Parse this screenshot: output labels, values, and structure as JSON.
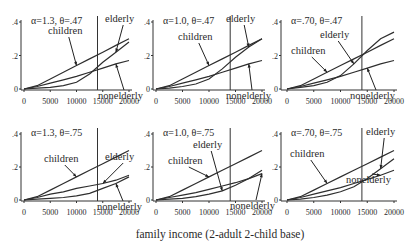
{
  "figure": {
    "xlabel": "family income (2-adult 2-child base)",
    "vertical_line_x": 14000
  },
  "chart_data": [
    {
      "type": "line",
      "title": "α=1.3, θ=.47",
      "xlabel": "family income (2-adult 2-child base)",
      "ylabel": "",
      "xlim": [
        0,
        20000
      ],
      "ylim": [
        0,
        0.4
      ],
      "x_ticks": [
        "0",
        "5000",
        "10000",
        "15000",
        "20000"
      ],
      "y_ticks": [
        "0",
        ".2",
        ".4"
      ],
      "vertical_line": 14000,
      "x": [
        0,
        2500,
        5000,
        7500,
        10000,
        12500,
        15000,
        17500,
        20000
      ],
      "series": [
        {
          "name": "children",
          "values": [
            0,
            0.02,
            0.06,
            0.1,
            0.14,
            0.18,
            0.22,
            0.26,
            0.3
          ]
        },
        {
          "name": "elderly",
          "values": [
            0,
            0.005,
            0.01,
            0.02,
            0.04,
            0.09,
            0.16,
            0.22,
            0.28
          ]
        },
        {
          "name": "nonelderly",
          "values": [
            0,
            0.015,
            0.035,
            0.055,
            0.075,
            0.1,
            0.125,
            0.15,
            0.17
          ]
        }
      ]
    },
    {
      "type": "line",
      "title": "α=1.0, θ=.47",
      "xlabel": "family income (2-adult 2-child base)",
      "ylabel": "",
      "xlim": [
        0,
        20000
      ],
      "ylim": [
        0,
        0.4
      ],
      "x_ticks": [
        "0",
        "5000",
        "10000",
        "15000",
        "20000"
      ],
      "y_ticks": [
        "0",
        ".2",
        ".4"
      ],
      "vertical_line": 14000,
      "x": [
        0,
        2500,
        5000,
        7500,
        10000,
        12500,
        15000,
        17500,
        20000
      ],
      "series": [
        {
          "name": "children",
          "values": [
            0,
            0.02,
            0.06,
            0.1,
            0.14,
            0.18,
            0.22,
            0.26,
            0.3
          ]
        },
        {
          "name": "elderly",
          "values": [
            0,
            0.005,
            0.015,
            0.03,
            0.06,
            0.12,
            0.19,
            0.25,
            0.3
          ]
        },
        {
          "name": "nonelderly",
          "values": [
            0,
            0.015,
            0.035,
            0.055,
            0.075,
            0.1,
            0.125,
            0.15,
            0.17
          ]
        }
      ]
    },
    {
      "type": "line",
      "title": "α=.70, θ=.47",
      "xlabel": "family income (2-adult 2-child base)",
      "ylabel": "",
      "xlim": [
        0,
        20000
      ],
      "ylim": [
        0,
        0.4
      ],
      "x_ticks": [
        "0",
        "5000",
        "10000",
        "15000",
        "20000"
      ],
      "y_ticks": [
        "0",
        ".2",
        ".4"
      ],
      "vertical_line": 14000,
      "x": [
        0,
        2500,
        5000,
        7500,
        10000,
        12500,
        15000,
        17500,
        20000
      ],
      "series": [
        {
          "name": "children",
          "values": [
            0,
            0.02,
            0.06,
            0.1,
            0.14,
            0.18,
            0.22,
            0.26,
            0.3
          ]
        },
        {
          "name": "elderly",
          "values": [
            0,
            0.01,
            0.02,
            0.04,
            0.08,
            0.15,
            0.23,
            0.3,
            0.34
          ]
        },
        {
          "name": "nonelderly",
          "values": [
            0,
            0.015,
            0.035,
            0.055,
            0.075,
            0.1,
            0.125,
            0.15,
            0.17
          ]
        }
      ]
    },
    {
      "type": "line",
      "title": "α=1.3, θ=.75",
      "xlabel": "family income (2-adult 2-child base)",
      "ylabel": "",
      "xlim": [
        0,
        20000
      ],
      "ylim": [
        0,
        0.4
      ],
      "x_ticks": [
        "0",
        "5000",
        "10000",
        "15000",
        "20000"
      ],
      "y_ticks": [
        "0",
        ".2",
        ".4"
      ],
      "vertical_line": 14000,
      "x": [
        0,
        2500,
        5000,
        7500,
        10000,
        12500,
        15000,
        17500,
        20000
      ],
      "series": [
        {
          "name": "children",
          "values": [
            0,
            0.02,
            0.06,
            0.1,
            0.14,
            0.18,
            0.22,
            0.26,
            0.3
          ]
        },
        {
          "name": "elderly",
          "values": [
            0,
            0.015,
            0.035,
            0.05,
            0.07,
            0.085,
            0.1,
            0.12,
            0.15
          ]
        },
        {
          "name": "nonelderly",
          "values": [
            0,
            0.005,
            0.01,
            0.015,
            0.025,
            0.04,
            0.07,
            0.1,
            0.14
          ]
        }
      ]
    },
    {
      "type": "line",
      "title": "α=1.0, θ=.75",
      "xlabel": "family income (2-adult 2-child base)",
      "ylabel": "",
      "xlim": [
        0,
        20000
      ],
      "ylim": [
        0,
        0.4
      ],
      "x_ticks": [
        "0",
        "5000",
        "10000",
        "15000",
        "20000"
      ],
      "y_ticks": [
        "0",
        ".2",
        ".4"
      ],
      "vertical_line": 14000,
      "x": [
        0,
        2500,
        5000,
        7500,
        10000,
        12500,
        15000,
        17500,
        20000
      ],
      "series": [
        {
          "name": "children",
          "values": [
            0,
            0.02,
            0.06,
            0.1,
            0.14,
            0.18,
            0.22,
            0.26,
            0.3
          ]
        },
        {
          "name": "elderly",
          "values": [
            0,
            0.005,
            0.01,
            0.02,
            0.035,
            0.055,
            0.09,
            0.13,
            0.18
          ]
        },
        {
          "name": "nonelderly",
          "values": [
            0,
            0.015,
            0.03,
            0.045,
            0.065,
            0.085,
            0.105,
            0.13,
            0.16
          ]
        }
      ]
    },
    {
      "type": "line",
      "title": "α=.70, θ=.75",
      "xlabel": "family income (2-adult 2-child base)",
      "ylabel": "",
      "xlim": [
        0,
        20000
      ],
      "ylim": [
        0,
        0.4
      ],
      "x_ticks": [
        "0",
        "5000",
        "10000",
        "15000",
        "20000"
      ],
      "y_ticks": [
        "0",
        ".2",
        ".4"
      ],
      "vertical_line": 14000,
      "x": [
        0,
        2500,
        5000,
        7500,
        10000,
        12500,
        15000,
        17500,
        20000
      ],
      "series": [
        {
          "name": "children",
          "values": [
            0,
            0.02,
            0.06,
            0.1,
            0.14,
            0.18,
            0.22,
            0.26,
            0.3
          ]
        },
        {
          "name": "elderly",
          "values": [
            0,
            0.005,
            0.015,
            0.03,
            0.05,
            0.08,
            0.13,
            0.19,
            0.25
          ]
        },
        {
          "name": "nonelderly",
          "values": [
            0,
            0.015,
            0.035,
            0.055,
            0.075,
            0.1,
            0.125,
            0.15,
            0.18
          ]
        }
      ]
    }
  ]
}
